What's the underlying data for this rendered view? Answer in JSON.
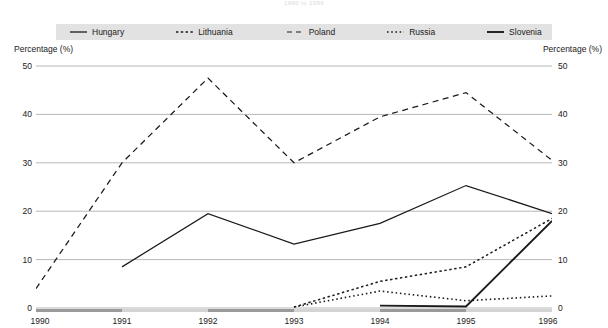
{
  "title": "1990 to 1996",
  "axis": {
    "left_caption": "Percentage (%)",
    "right_caption": "Percentage (%)",
    "yticks": [
      "0",
      "10",
      "20",
      "30",
      "40",
      "50"
    ],
    "xticks": [
      "1990",
      "1991",
      "1992",
      "1993",
      "1994",
      "1995",
      "1996"
    ]
  },
  "legend": {
    "items": [
      {
        "label": "Hungary",
        "style": "solid",
        "key": "hungary"
      },
      {
        "label": "Lithuania",
        "style": "dotted-med",
        "key": "lithuania"
      },
      {
        "label": "Poland",
        "style": "dashed",
        "key": "poland"
      },
      {
        "label": "Russia",
        "style": "dotted-fine",
        "key": "russia"
      },
      {
        "label": "Slovenia",
        "style": "solid-thick",
        "key": "slovenia"
      }
    ]
  },
  "colors": {
    "line": "#1a1a1a",
    "grid": "#9a9a9a",
    "legend_background": "#e2e2e2",
    "band_dark": "#9a9a9a",
    "band_light": "#d4d4d4",
    "title": "#d8d8dc"
  },
  "chart_data": {
    "type": "line",
    "title": "1990 to 1996",
    "xlabel": "",
    "ylabel": "Percentage (%)",
    "x": [
      1990,
      1991,
      1992,
      1993,
      1994,
      1995,
      1996
    ],
    "ylim": [
      0,
      50
    ],
    "xlim": [
      1990,
      1996
    ],
    "grid": true,
    "legend_position": "top",
    "series": [
      {
        "name": "Hungary",
        "style": "solid",
        "x": [
          1991,
          1992,
          1993,
          1994,
          1995,
          1996
        ],
        "values": [
          8.5,
          19.5,
          13.2,
          17.5,
          25.3,
          19.5
        ]
      },
      {
        "name": "Lithuania",
        "style": "dotted-med",
        "x": [
          1993,
          1994,
          1995,
          1996
        ],
        "values": [
          0.2,
          5.5,
          8.5,
          18.5
        ]
      },
      {
        "name": "Poland",
        "style": "dashed",
        "x": [
          1990,
          1991,
          1992,
          1993,
          1994,
          1995,
          1996
        ],
        "values": [
          4.0,
          30.0,
          47.5,
          30.0,
          39.5,
          44.5,
          30.5
        ]
      },
      {
        "name": "Russia",
        "style": "dotted-fine",
        "x": [
          1993,
          1994,
          1995,
          1996
        ],
        "values": [
          0.2,
          3.5,
          1.5,
          2.5
        ]
      },
      {
        "name": "Slovenia",
        "style": "solid-thick",
        "x": [
          1994,
          1995,
          1996
        ],
        "values": [
          0.5,
          0.3,
          18.0
        ]
      }
    ],
    "axis_band": [
      {
        "from": 1990,
        "to": 1991,
        "shade": "dark"
      },
      {
        "from": 1991,
        "to": 1992,
        "shade": "light"
      },
      {
        "from": 1992,
        "to": 1993,
        "shade": "dark"
      },
      {
        "from": 1993,
        "to": 1994,
        "shade": "light"
      },
      {
        "from": 1994,
        "to": 1995,
        "shade": "dark"
      },
      {
        "from": 1995,
        "to": 1996,
        "shade": "light"
      }
    ]
  }
}
